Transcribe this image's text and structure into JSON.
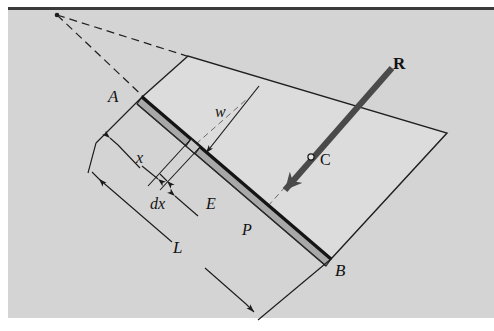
{
  "figure": {
    "kind": "engineering-mechanics-beam-diagram",
    "background_color": "#d4d4d4",
    "paper_color": "#ffffff",
    "ink_color": "#1a1a1a",
    "beam_face_color": "#a8a8a8",
    "beam_edge_color": "#1f1f1f",
    "load_area_color": "#dcdcdc",
    "arrow_color": "#4a4a4a"
  },
  "labels": {
    "point_a": "A",
    "point_b": "B",
    "point_c": "C",
    "point_e": "E",
    "point_p": "P",
    "resultant": "R",
    "distance_x": "x",
    "element_dx": "dx",
    "length_l": "L",
    "load_intensity": "w"
  },
  "geometry": {
    "beam_start": [
      142,
      97
    ],
    "beam_end": [
      331,
      259
    ],
    "load_top_left": [
      188,
      56
    ],
    "load_top_right": [
      447,
      133
    ],
    "apex": [
      57,
      15
    ],
    "centroid_marker": [
      311,
      157
    ],
    "resultant_tail": [
      392,
      68
    ],
    "resultant_head": [
      275,
      201
    ],
    "element_position": [
      196,
      144
    ]
  },
  "annotations": {
    "dimension_x_label": "x",
    "dimension_dx_label": "dx",
    "dimension_L_label": "L",
    "intensity_w_label": "w",
    "resultant_label": "R",
    "centroid_label": "C"
  }
}
